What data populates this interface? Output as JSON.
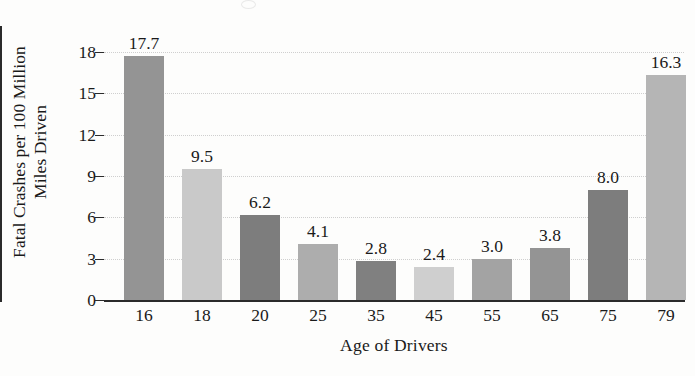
{
  "chart_data": {
    "type": "bar",
    "title": "",
    "xlabel": "Age of Drivers",
    "ylabel": "Fatal Crashes per 100 Million Miles Driven",
    "ylabel_lines": [
      "Fatal Crashes per 100 Million",
      "Miles Driven"
    ],
    "categories": [
      "16",
      "18",
      "20",
      "25",
      "35",
      "45",
      "55",
      "65",
      "75",
      "79"
    ],
    "values": [
      17.7,
      9.5,
      6.2,
      4.1,
      2.8,
      2.4,
      3.0,
      3.8,
      8.0,
      16.3
    ],
    "value_labels": [
      "17.7",
      "9.5",
      "6.2",
      "4.1",
      "2.8",
      "2.4",
      "3.0",
      "3.8",
      "8.0",
      "16.3"
    ],
    "bar_colors": [
      "#949494",
      "#c9c9c9",
      "#7d7d7d",
      "#adadad",
      "#808080",
      "#cfcfcf",
      "#a3a3a3",
      "#949494",
      "#7d7d7d",
      "#b5b5b5"
    ],
    "ylim": [
      0,
      18
    ],
    "yticks": [
      0,
      3,
      6,
      9,
      12,
      15,
      18
    ],
    "ytick_labels": [
      "0",
      "3",
      "6",
      "9",
      "12",
      "15",
      "18"
    ],
    "grid": true,
    "grid_color": "#cfcfcf",
    "legend": "none",
    "axis_color": "#2b2b2b",
    "background": "#fdfdfc"
  }
}
